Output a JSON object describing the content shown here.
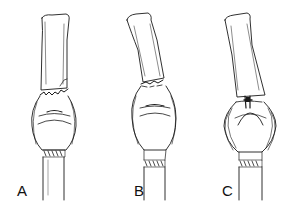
{
  "figure": {
    "panels": [
      {
        "id": "A",
        "label": "A",
        "description": "joint with fracture line across base of upper bone"
      },
      {
        "id": "B",
        "label": "B",
        "description": "joint with upper bone angled, fracture at base"
      },
      {
        "id": "C",
        "label": "C",
        "description": "joint with intra-articular fracture fragment at base"
      }
    ]
  },
  "colors": {
    "line": "#1a1a1a",
    "background": "#ffffff"
  }
}
